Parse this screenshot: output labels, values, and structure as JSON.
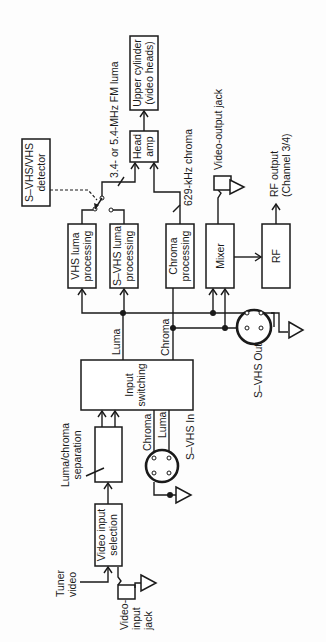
{
  "diagram": {
    "orientation": "rotated 90 degrees counter-clockwise",
    "colors": {
      "ink": "#1a1a1a",
      "background": "#fdfdfd"
    },
    "blocks": {
      "upper_cylinder": {
        "line1": "Upper cylinder",
        "line2": "(video heads)"
      },
      "head_amp": {
        "line1": "Head",
        "line2": "amp"
      },
      "detector": {
        "line1": "S–VHS/VHS",
        "line2": "detector"
      },
      "vhs_luma": {
        "line1": "VHS luma",
        "line2": "processing"
      },
      "svhs_luma": {
        "line1": "S–VHS luma",
        "line2": "processing"
      },
      "chroma_proc": {
        "line1": "Chroma",
        "line2": "processing"
      },
      "mixer": {
        "line1": "Mixer"
      },
      "rf": {
        "line1": "RF"
      },
      "input_switching": {
        "line1": "Input",
        "line2": "switching"
      },
      "luma_chroma_sep": {
        "line1": "Luma/chroma",
        "line2": "separation"
      },
      "video_input_sel": {
        "line1": "Video input",
        "line2": "selection"
      }
    },
    "labels": {
      "fm_luma": "3.4- or 5.4-MHz FM luma",
      "chroma_629": "629-kHz chroma",
      "video_output_jack": "Video-output jack",
      "rf_output_line1": "RF output",
      "rf_output_line2": "(Channel 3/4)",
      "luma": "Luma",
      "chroma": "Chroma",
      "svhs_out": "S–VHS Out",
      "svhs_in": "S–VHS In",
      "in_chroma": "Chroma",
      "in_luma": "Luma",
      "tuner_line1": "Tuner",
      "tuner_line2": "video",
      "jack_line1": "Video-",
      "jack_line2": "input",
      "jack_line3": "jack"
    },
    "connectors": [
      {
        "name": "S–VHS Out",
        "type": "4-pin mini-DIN"
      },
      {
        "name": "S–VHS In",
        "type": "4-pin mini-DIN"
      }
    ]
  }
}
